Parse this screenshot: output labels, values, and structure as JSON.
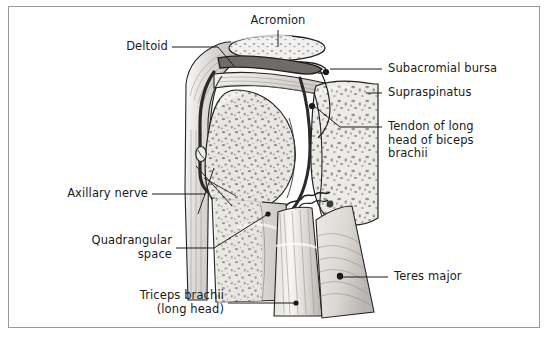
{
  "figure": {
    "type": "anatomical-illustration",
    "style": "grayscale line drawing with stipple shading",
    "background_color": "#ffffff",
    "frame_color": "#9a9a9a",
    "line_color": "#1a1a1a",
    "text_color": "#1a1a1a"
  },
  "labels": {
    "acromion": "Acromion",
    "deltoid": "Deltoid",
    "subacromial_bursa": "Subacromial bursa",
    "supraspinatus": "Supraspinatus",
    "biceps_tendon_line1": "Tendon of long",
    "biceps_tendon_line2": "head of biceps",
    "biceps_tendon_line3": "brachii",
    "axillary_nerve": "Axillary nerve",
    "quadrangular_line1": "Quadrangular",
    "quadrangular_line2": "space",
    "triceps_line1": "Triceps brachii",
    "triceps_line2": "(long head)",
    "teres_major": "Teres major"
  },
  "structures": [
    {
      "name": "acromion",
      "label": "Acromion",
      "side": "top"
    },
    {
      "name": "deltoid",
      "label": "Deltoid",
      "side": "left"
    },
    {
      "name": "subacromial-bursa",
      "label": "Subacromial bursa",
      "side": "right"
    },
    {
      "name": "supraspinatus",
      "label": "Supraspinatus",
      "side": "right"
    },
    {
      "name": "biceps-tendon",
      "label": "Tendon of long head of biceps brachii",
      "side": "right"
    },
    {
      "name": "axillary-nerve",
      "label": "Axillary nerve",
      "side": "left"
    },
    {
      "name": "quadrangular-space",
      "label": "Quadrangular space",
      "side": "left"
    },
    {
      "name": "triceps-brachii",
      "label": "Triceps brachii (long head)",
      "side": "left"
    },
    {
      "name": "teres-major",
      "label": "Teres major",
      "side": "right"
    }
  ]
}
